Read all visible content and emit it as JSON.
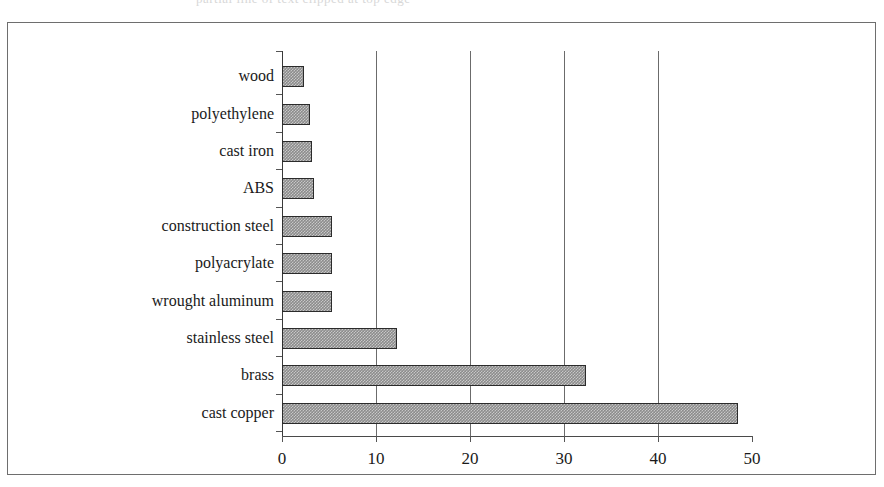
{
  "top_strip": {
    "clipped_text": "partial line of text clipped at top edge"
  },
  "chart_data": {
    "type": "bar",
    "orientation": "horizontal",
    "title": "",
    "xlabel": "",
    "ylabel": "",
    "xlim": [
      0,
      50
    ],
    "xticks": [
      0,
      10,
      20,
      30,
      40,
      50
    ],
    "xtick_labels": [
      "0",
      "10",
      "20",
      "30",
      "40",
      "50"
    ],
    "grid": "vertical gridlines at 10, 20, 30, 40",
    "legend": "none",
    "bar_fill_color": "#8c8c8c",
    "bar_edge_color": "#2b2b2b",
    "frame_color": "#6e6e6e",
    "categories": [
      "wood",
      "polyethylene",
      "cast iron",
      "ABS",
      "construction steel",
      "polyacrylate",
      "wrought aluminum",
      "stainless steel",
      "brass",
      "cast copper"
    ],
    "values": [
      2.3,
      3.0,
      3.2,
      3.4,
      5.3,
      5.3,
      5.3,
      12.2,
      32.3,
      48.5
    ]
  }
}
